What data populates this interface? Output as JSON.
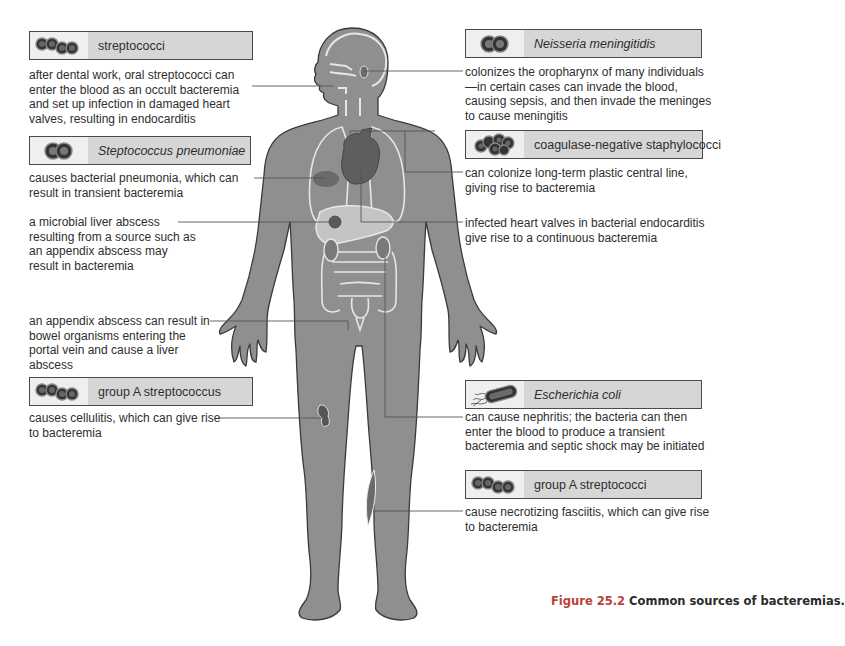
{
  "figure": {
    "caption_number": "Figure 25.2",
    "caption_text": " Common sources of bacteremias."
  },
  "left": [
    {
      "organism": "streptococci",
      "italic": false,
      "icon": "streptococci-chain-icon",
      "description": "after dental work, oral streptococci can enter the blood as an occult bacteremia and set up infection in damaged heart valves, resulting in endocarditis"
    },
    {
      "organism": "Steptococcus pneumoniae",
      "italic": true,
      "icon": "diplococcus-icon",
      "description": "causes bacterial pneumonia, which can result in transient bacteremia"
    },
    {
      "organism": "",
      "description": "a microbial liver abscess resulting from a source such as an appendix abscess may result in bacteremia"
    },
    {
      "organism": "",
      "description": "an appendix abscess can result in bowel organisms entering the portal vein and cause a liver abscess"
    },
    {
      "organism": "group A streptococcus",
      "italic": false,
      "icon": "streptococci-chain-icon",
      "description": "causes cellulitis, which can give rise to bacteremia"
    }
  ],
  "right": [
    {
      "organism": "Neisseria meningitidis",
      "italic": true,
      "icon": "diplococcus-icon",
      "description": "colonizes the oropharynx of many individuals—in certain cases can invade the blood, causing sepsis, and then invade the meninges to cause meningitis"
    },
    {
      "organism": "coagulase-negative staphylococci",
      "italic": false,
      "icon": "staphylococci-cluster-icon",
      "description": "can colonize long-term plastic central line, giving rise to bacteremia"
    },
    {
      "organism": "",
      "description": "infected heart valves in bacterial endocarditis give rise to a continuous bacteremia"
    },
    {
      "organism": "Escherichia coli",
      "italic": true,
      "icon": "bacillus-flagella-icon",
      "description": "can cause nephritis; the bacteria can then enter the blood to produce a transient bacteremia and septic shock may be initiated"
    },
    {
      "organism": "group A streptococci",
      "italic": false,
      "icon": "streptococci-chain-icon",
      "description": "cause necrotizing fasciitis, which can give rise to bacteremia"
    }
  ],
  "colors": {
    "body_fill": "#8f8f8f",
    "organ_outline": "#e6e6e6",
    "lesion": "#5f5f5f",
    "box_label_bg": "#d6d6d6",
    "box_icon_bg": "#efefef",
    "caption_accent": "#b8413a"
  }
}
